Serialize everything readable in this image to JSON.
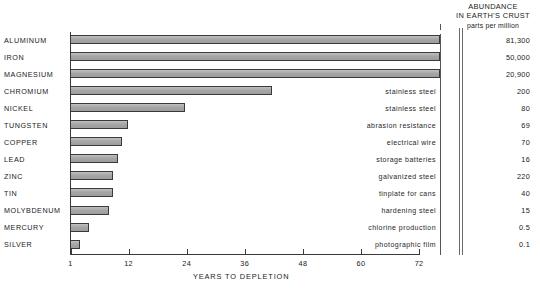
{
  "header": {
    "line1": "ABUNDANCE",
    "line2": "IN EARTH'S CRUST",
    "line3": "parts per million"
  },
  "axis": {
    "title": "YEARS TO DEPLETION",
    "ticks": [
      "1",
      "12",
      "24",
      "36",
      "48",
      "60",
      "72"
    ]
  },
  "rows": [
    {
      "metal": "ALUMINUM",
      "use": "",
      "ppm": "81,300"
    },
    {
      "metal": "IRON",
      "use": "",
      "ppm": "50,000"
    },
    {
      "metal": "MAGNESIUM",
      "use": "",
      "ppm": "20,900"
    },
    {
      "metal": "CHROMIUM",
      "use": "stainless steel",
      "ppm": "200"
    },
    {
      "metal": "NICKEL",
      "use": "stainless steel",
      "ppm": "80"
    },
    {
      "metal": "TUNGSTEN",
      "use": "abrasion resistance",
      "ppm": "69"
    },
    {
      "metal": "COPPER",
      "use": "electrical wire",
      "ppm": "70"
    },
    {
      "metal": "LEAD",
      "use": "storage batteries",
      "ppm": "16"
    },
    {
      "metal": "ZINC",
      "use": "galvanized steel",
      "ppm": "220"
    },
    {
      "metal": "TIN",
      "use": "tinplate for cans",
      "ppm": "40"
    },
    {
      "metal": "MOLYBDENUM",
      "use": "hardening steel",
      "ppm": "15"
    },
    {
      "metal": "MERCURY",
      "use": "chlorine production",
      "ppm": "0.5"
    },
    {
      "metal": "SILVER",
      "use": "photographic film",
      "ppm": "0.1"
    }
  ],
  "chart_data": {
    "type": "bar",
    "orientation": "horizontal",
    "title": "",
    "xlabel": "YEARS TO DEPLETION",
    "ylabel": "",
    "xlim": [
      1,
      76
    ],
    "xticks": [
      1,
      12,
      24,
      36,
      48,
      60,
      72
    ],
    "grid": false,
    "legend": null,
    "categories": [
      "ALUMINUM",
      "IRON",
      "MAGNESIUM",
      "CHROMIUM",
      "NICKEL",
      "TUNGSTEN",
      "COPPER",
      "LEAD",
      "ZINC",
      "TIN",
      "MOLYBDENUM",
      "MERCURY",
      "SILVER"
    ],
    "values": [
      76,
      76,
      76,
      42,
      24.8,
      13,
      11.5,
      11,
      10,
      10,
      9.5,
      5,
      2.5
    ],
    "bar_pixel_widths": [
      370,
      370,
      370,
      202,
      115,
      58,
      52,
      48,
      43,
      43,
      39,
      19,
      10
    ],
    "annotations": {
      "uses": [
        "",
        "",
        "",
        "stainless steel",
        "stainless steel",
        "abrasion resistance",
        "electrical wire",
        "storage batteries",
        "galvanized steel",
        "tinplate for cans",
        "hardening steel",
        "chlorine production",
        "photographic film"
      ],
      "abundance_ppm": [
        "81,300",
        "50,000",
        "20,900",
        "200",
        "80",
        "69",
        "70",
        "16",
        "220",
        "40",
        "15",
        "0.5",
        "0.1"
      ],
      "abundance_header": "ABUNDANCE IN EARTH'S CRUST parts per million"
    }
  },
  "colors": {
    "bar_fill": "#a9a9a9",
    "bar_stroke": "#3a3a3a",
    "axis": "#3a3a3a",
    "text": "#1a1a1a",
    "background": "#ffffff"
  }
}
